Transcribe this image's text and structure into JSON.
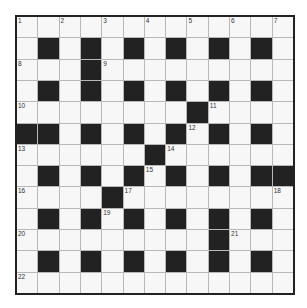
{
  "puzzle": {
    "rows": 13,
    "cols": 13,
    "colors": {
      "black": "#222222",
      "white": "#f7f7f7",
      "gridline": "#b8b8b8",
      "border": "#222222"
    },
    "layout": [
      ".............",
      ".#.#.#.#.#.#.",
      "...#.........",
      ".#.#.#.#.#.#.",
      "........#....",
      "##.#.#.#.#.#.",
      "......#......",
      ".#.#.#.#.#.##",
      "....#........",
      ".#.#.#.#.#.#.",
      ".........#...",
      ".#.#.#.#.#.#.",
      "............."
    ],
    "numbers": [
      {
        "row": 0,
        "col": 0,
        "n": "1"
      },
      {
        "row": 0,
        "col": 2,
        "n": "2"
      },
      {
        "row": 0,
        "col": 4,
        "n": "3"
      },
      {
        "row": 0,
        "col": 6,
        "n": "4"
      },
      {
        "row": 0,
        "col": 8,
        "n": "5"
      },
      {
        "row": 0,
        "col": 10,
        "n": "6"
      },
      {
        "row": 0,
        "col": 12,
        "n": "7"
      },
      {
        "row": 2,
        "col": 0,
        "n": "8"
      },
      {
        "row": 2,
        "col": 4,
        "n": "9"
      },
      {
        "row": 4,
        "col": 0,
        "n": "10"
      },
      {
        "row": 4,
        "col": 9,
        "n": "11"
      },
      {
        "row": 5,
        "col": 8,
        "n": "12"
      },
      {
        "row": 6,
        "col": 0,
        "n": "13"
      },
      {
        "row": 6,
        "col": 7,
        "n": "14"
      },
      {
        "row": 7,
        "col": 6,
        "n": "15"
      },
      {
        "row": 8,
        "col": 0,
        "n": "16"
      },
      {
        "row": 8,
        "col": 5,
        "n": "17"
      },
      {
        "row": 8,
        "col": 12,
        "n": "18"
      },
      {
        "row": 9,
        "col": 4,
        "n": "19"
      },
      {
        "row": 10,
        "col": 0,
        "n": "20"
      },
      {
        "row": 10,
        "col": 10,
        "n": "21"
      },
      {
        "row": 12,
        "col": 0,
        "n": "22"
      }
    ]
  }
}
